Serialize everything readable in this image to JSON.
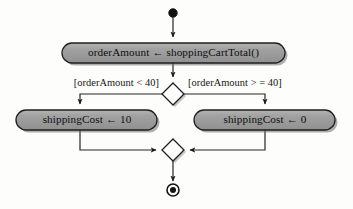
{
  "diagram": {
    "type": "uml-activity-diagram",
    "title": "",
    "style": {
      "background": "#fdfdfc",
      "node_fill": "#9b9b9b",
      "node_stroke": "#1f1f1f",
      "node_highlight": "#b9b9b9",
      "shadow": "#6e6e6e",
      "edge_stroke": "#262626",
      "text_color": "#0d0d0d"
    },
    "nodes": {
      "start": {
        "kind": "initial-node",
        "label": "",
        "cx": 173,
        "cy": 13,
        "r": 4.2
      },
      "action_order_amount": {
        "kind": "action",
        "label": "orderAmount ← shoppingCartTotal()",
        "x": 62,
        "y": 43,
        "w": 223,
        "h": 20
      },
      "decision": {
        "kind": "decision-node",
        "label": "",
        "cx": 173,
        "cy": 94,
        "rx": 11,
        "ry": 11
      },
      "action_shipping_10": {
        "kind": "action",
        "label": "shippingCost ← 10",
        "x": 16,
        "y": 110,
        "w": 141,
        "h": 20
      },
      "action_shipping_0": {
        "kind": "action",
        "label": "shippingCost ← 0",
        "x": 194,
        "y": 110,
        "w": 141,
        "h": 20
      },
      "merge": {
        "kind": "merge-node",
        "label": "",
        "cx": 173,
        "cy": 150,
        "rx": 11,
        "ry": 11
      },
      "end": {
        "kind": "final-node",
        "label": "",
        "cx": 173,
        "cy": 190,
        "r_outer": 6,
        "r_inner": 3
      }
    },
    "guards": {
      "left": {
        "text": "[orderAmount < 40]",
        "x": 157,
        "y": 84
      },
      "right": {
        "text": "[orderAmount > = 40]",
        "x": 189,
        "y": 84
      }
    },
    "edges": [
      {
        "from": "start",
        "to": "action_order_amount",
        "label": ""
      },
      {
        "from": "action_order_amount",
        "to": "decision",
        "label": ""
      },
      {
        "from": "decision",
        "to": "action_shipping_10",
        "label": "[orderAmount < 40]"
      },
      {
        "from": "decision",
        "to": "action_shipping_0",
        "label": "[orderAmount > = 40]"
      },
      {
        "from": "action_shipping_10",
        "to": "merge",
        "label": ""
      },
      {
        "from": "action_shipping_0",
        "to": "merge",
        "label": ""
      },
      {
        "from": "merge",
        "to": "end",
        "label": ""
      }
    ]
  }
}
